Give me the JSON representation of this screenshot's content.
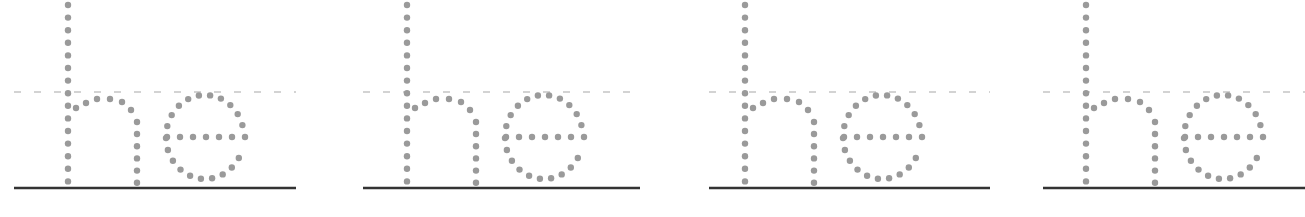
{
  "worksheet": {
    "title": "Letter tracing practice",
    "practice_text": "he",
    "colors": {
      "dot": "#9a9a9a",
      "midline": "#a8a8a8",
      "baseline": "#333333",
      "background": "#ffffff"
    },
    "panels": [
      {
        "label": "he",
        "offset_x": 0,
        "line_start": 14,
        "line_end": 296
      },
      {
        "label": "he",
        "offset_x": 339,
        "line_start": 24,
        "line_end": 301
      },
      {
        "label": "he",
        "offset_x": 677,
        "line_start": 32,
        "line_end": 313
      },
      {
        "label": "he",
        "offset_x": 1018,
        "line_start": 25,
        "line_end": 287
      }
    ],
    "geometry": {
      "midline_y": 92,
      "baseline_y": 188,
      "dot_radius": 3.2,
      "stem_x": 68,
      "stem_top": 5,
      "stem_bottom": 183,
      "stem_step": 12.6,
      "arch_right_x": 137,
      "arch_top_y": 97,
      "right_leg_top": 122,
      "e_cx": 205,
      "e_cy": 137,
      "e_rx": 39,
      "e_ry": 42,
      "e_bar_x1": 167,
      "e_bar_x2": 245
    }
  }
}
